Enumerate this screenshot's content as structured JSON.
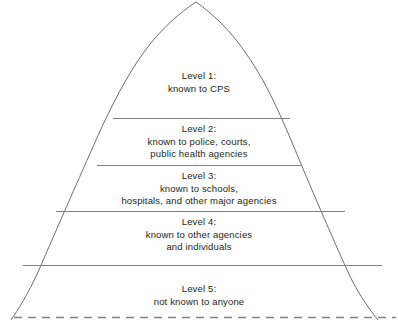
{
  "diagram": {
    "type": "pyramid",
    "shape_name": "five-level-pyramid",
    "background_color": "#ffffff",
    "outline_color": "#6d6e71",
    "divider_color": "#808285",
    "text_color": "#231f20",
    "baseline_style": "dashed",
    "levels": [
      {
        "id": "level-1",
        "title": "Level 1:",
        "description": "known to CPS",
        "text": "Level 1:\nknown to CPS"
      },
      {
        "id": "level-2",
        "title": "Level 2:",
        "description": "known to police, courts,\npublic health agencies",
        "text": "Level 2:\nknown to police, courts,\npublic health agencies"
      },
      {
        "id": "level-3",
        "title": "Level 3:",
        "description": "known to schools,\nhospitals, and other major agencies",
        "text": "Level 3:\nknown to schools,\nhospitals, and other major agencies"
      },
      {
        "id": "level-4",
        "title": "Level 4:",
        "description": "known to other agencies\nand individuals",
        "text": "Level 4:\nknown to other agencies\nand individuals"
      },
      {
        "id": "level-5",
        "title": "Level 5:",
        "description": "not known to anyone",
        "text": "Level 5:\nnot known to anyone"
      }
    ]
  }
}
